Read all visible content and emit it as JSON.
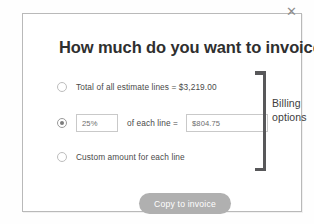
{
  "dialog": {
    "title": "How much do you want to invoice?",
    "close_icon": "close-icon",
    "close_glyph": "✕"
  },
  "options": [
    {
      "id": "total-all-lines",
      "label": "Total of all estimate lines = $3,219.00",
      "selected": false,
      "total_amount": "$3,219.00"
    },
    {
      "id": "percent-each-line",
      "selected": true,
      "percent_value": "25%",
      "middle_label": "of each line =",
      "amount_value": "$804.75"
    },
    {
      "id": "custom-amount",
      "label": "Custom amount for each line",
      "selected": false
    }
  ],
  "annotation": {
    "line1": "Billing",
    "line2": "options",
    "bracket_icon": "right-bracket-icon",
    "bracket_color": "#58585a"
  },
  "footer": {
    "primary_button_label": "Copy to invoice",
    "primary_button_color": "#b0b0b0"
  }
}
